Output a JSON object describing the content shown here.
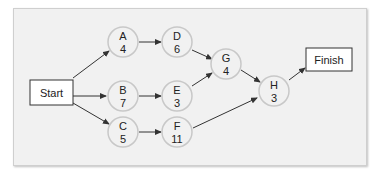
{
  "diagram": {
    "type": "activity-on-node network",
    "start": {
      "label": "Start"
    },
    "finish": {
      "label": "Finish"
    },
    "nodes": [
      {
        "id": "A",
        "name": "A",
        "duration": "4"
      },
      {
        "id": "B",
        "name": "B",
        "duration": "7"
      },
      {
        "id": "C",
        "name": "C",
        "duration": "5"
      },
      {
        "id": "D",
        "name": "D",
        "duration": "6"
      },
      {
        "id": "E",
        "name": "E",
        "duration": "3"
      },
      {
        "id": "F",
        "name": "F",
        "duration": "11"
      },
      {
        "id": "G",
        "name": "G",
        "duration": "4"
      },
      {
        "id": "H",
        "name": "H",
        "duration": "3"
      }
    ],
    "edges": [
      [
        "Start",
        "A"
      ],
      [
        "Start",
        "B"
      ],
      [
        "Start",
        "C"
      ],
      [
        "A",
        "D"
      ],
      [
        "B",
        "E"
      ],
      [
        "C",
        "F"
      ],
      [
        "D",
        "G"
      ],
      [
        "E",
        "G"
      ],
      [
        "G",
        "H"
      ],
      [
        "F",
        "H"
      ],
      [
        "H",
        "Finish"
      ]
    ],
    "colors": {
      "panel": "#f1f1f1",
      "node_fill": "#f1f1f1",
      "node_stroke": "#c8c8c8",
      "arrow": "#333333",
      "box_stroke": "#333333"
    }
  }
}
